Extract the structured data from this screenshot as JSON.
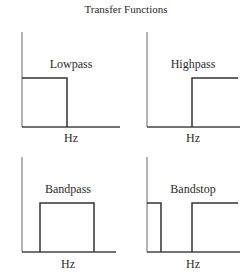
{
  "title": "Transfer Functions",
  "panels": [
    {
      "name": "Lowpass",
      "xlabel": "Hz"
    },
    {
      "name": "Highpass",
      "xlabel": "Hz"
    },
    {
      "name": "Bandpass",
      "xlabel": "Hz"
    },
    {
      "name": "Bandstop",
      "xlabel": "Hz"
    }
  ],
  "colors": {
    "line": "#3a3a3a",
    "axis": "#555555"
  }
}
